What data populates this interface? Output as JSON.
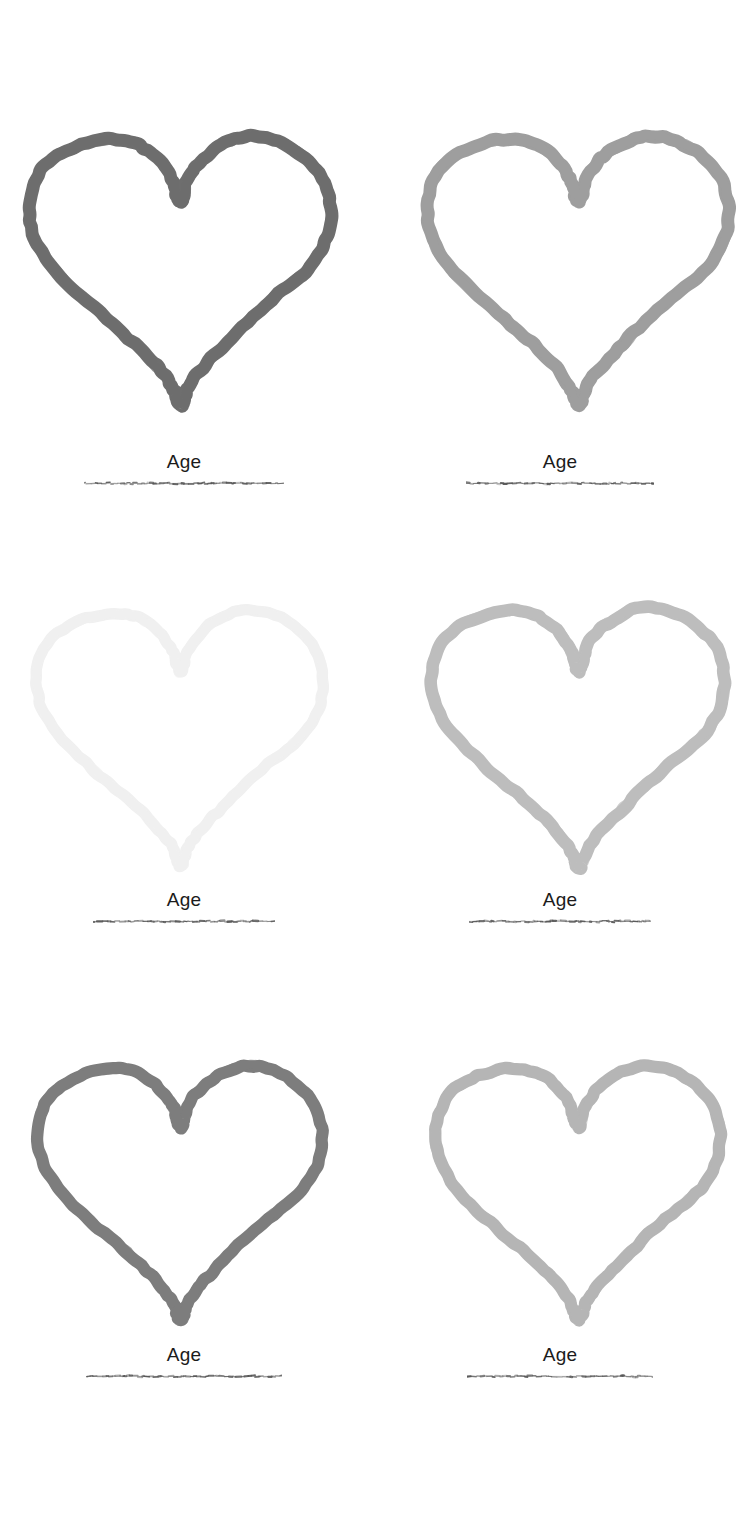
{
  "page": {
    "background_color": "#ffffff",
    "width": 736,
    "height": 1519,
    "layout": "2-column x 3-row grid of hand-drawn heart outlines"
  },
  "label_style": {
    "text_color": "#1b1b1b",
    "underline_color": "#555555"
  },
  "panels": [
    {
      "id": "panel-top-left",
      "row": 1,
      "column": 1,
      "icon_name": "heart-outline-icon",
      "stroke_color": "#6e6e6e",
      "stroke_width": 13,
      "label": "Age",
      "underline": "scribble-underline"
    },
    {
      "id": "panel-top-right",
      "row": 1,
      "column": 2,
      "icon_name": "heart-outline-icon",
      "stroke_color": "#9e9e9e",
      "stroke_width": 13,
      "label": "Age",
      "underline": "scribble-underline"
    },
    {
      "id": "panel-middle-left",
      "row": 2,
      "column": 1,
      "icon_name": "heart-outline-icon",
      "stroke_color": "#f0f0f0",
      "stroke_width": 12,
      "label": "Age",
      "underline": "scribble-underline"
    },
    {
      "id": "panel-middle-right",
      "row": 2,
      "column": 2,
      "icon_name": "heart-outline-icon",
      "stroke_color": "#bdbdbd",
      "stroke_width": 13,
      "label": "Age",
      "underline": "scribble-underline"
    },
    {
      "id": "panel-bottom-left",
      "row": 3,
      "column": 1,
      "icon_name": "heart-outline-icon",
      "stroke_color": "#7d7d7d",
      "stroke_width": 13,
      "label": "Age",
      "underline": "scribble-underline"
    },
    {
      "id": "panel-bottom-right",
      "row": 3,
      "column": 2,
      "icon_name": "heart-outline-icon",
      "stroke_color": "#b5b5b5",
      "stroke_width": 13,
      "label": "Age",
      "underline": "scribble-underline"
    }
  ]
}
